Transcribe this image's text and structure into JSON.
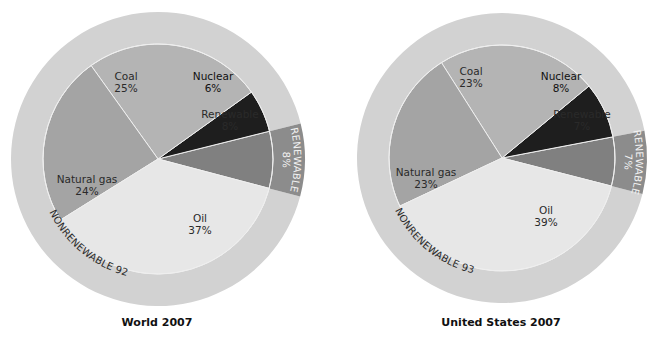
{
  "chart_data": [
    {
      "type": "pie",
      "title": "World 2007",
      "geometry": {
        "cx": 158,
        "cy": 159,
        "inner_r": 115,
        "outer_r": 147,
        "start_angle_deg": -14.8
      },
      "categories": [
        "Renewable",
        "Nuclear",
        "Coal",
        "Natural gas",
        "Oil"
      ],
      "values": [
        8,
        6,
        25,
        24,
        37
      ],
      "labels": [
        {
          "name": "Renewable",
          "pct": "8%",
          "x": 230,
          "y": 118
        },
        {
          "name": "Nuclear",
          "pct": "6%",
          "x": 213,
          "y": 80
        },
        {
          "name": "Coal",
          "pct": "25%",
          "x": 126,
          "y": 80
        },
        {
          "name": "Natural gas",
          "pct": "24%",
          "x": 87,
          "y": 183
        },
        {
          "name": "Oil",
          "pct": "37%",
          "x": 200,
          "y": 222
        }
      ],
      "outer_ring": [
        {
          "name": "RENEWABLE",
          "pct": "8%",
          "value": 8
        },
        {
          "name": "NONRENEWABLE",
          "pct": "92%",
          "value": 92
        }
      ],
      "ring_text": {
        "renewable": "RENEWABLE",
        "renewable_pct": "8%",
        "nonrenewable": "NONRENEWABLE 92%"
      }
    },
    {
      "type": "pie",
      "title": "United States 2007",
      "geometry": {
        "cx": 502,
        "cy": 158,
        "inner_r": 113,
        "outer_r": 145,
        "start_angle_deg": -14.4
      },
      "categories": [
        "Renewable",
        "Nuclear",
        "Coal",
        "Natural gas",
        "Oil"
      ],
      "values": [
        7,
        8,
        23,
        23,
        39
      ],
      "labels": [
        {
          "name": "Renewable",
          "pct": "7%",
          "x": 582,
          "y": 118
        },
        {
          "name": "Nuclear",
          "pct": "8%",
          "x": 561,
          "y": 80
        },
        {
          "name": "Coal",
          "pct": "23%",
          "x": 471,
          "y": 75
        },
        {
          "name": "Natural gas",
          "pct": "23%",
          "x": 426,
          "y": 176
        },
        {
          "name": "Oil",
          "pct": "39%",
          "x": 546,
          "y": 214
        }
      ],
      "outer_ring": [
        {
          "name": "RENEWABLE",
          "pct": "7%",
          "value": 7
        },
        {
          "name": "NONRENEWABLE",
          "pct": "93%",
          "value": 93
        }
      ],
      "ring_text": {
        "renewable": "RENEWABLE",
        "renewable_pct": "7%",
        "nonrenewable": "NONRENEWABLE 93%"
      }
    }
  ],
  "colors": {
    "Renewable": "#808080",
    "Nuclear": "#1e1e1e",
    "Coal": "#b4b4b4",
    "Natural gas": "#a4a4a4",
    "Oil": "#e7e7e7",
    "ring_nonrenewable": "#d2d2d2",
    "ring_renewable": "#8c8c8c",
    "separator": "#efefef"
  },
  "titles": {
    "world": "World 2007",
    "us": "United States 2007"
  }
}
